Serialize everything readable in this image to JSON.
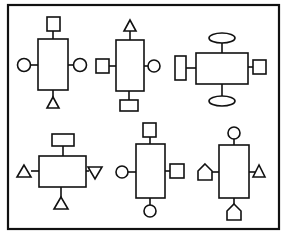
{
  "diagram": {
    "stroke_color": "#111111",
    "background": "#ffffff",
    "frame": {
      "x": 8,
      "y": 5,
      "width": 271,
      "height": 224
    },
    "nodes": [
      {
        "id": "node-1",
        "position": "top-left",
        "body": "tall-rectangle",
        "attachments": {
          "top": "square",
          "left": "circle",
          "right": "circle",
          "bottom": "triangle-up"
        }
      },
      {
        "id": "node-2",
        "position": "top-center",
        "body": "tall-rectangle",
        "attachments": {
          "top": "triangle-up",
          "left": "square",
          "right": "circle",
          "bottom": "wide-rectangle"
        }
      },
      {
        "id": "node-3",
        "position": "top-right",
        "body": "wide-rectangle",
        "attachments": {
          "top": "ellipse",
          "left": "tall-rectangle",
          "right": "square",
          "bottom": "ellipse"
        }
      },
      {
        "id": "node-4",
        "position": "bottom-left",
        "body": "wide-rectangle",
        "attachments": {
          "top": "wide-rectangle",
          "left": "triangle-up",
          "right": "triangle-down",
          "bottom": "triangle-up"
        }
      },
      {
        "id": "node-5",
        "position": "bottom-center",
        "body": "tall-rectangle",
        "attachments": {
          "top": "square",
          "left": "circle",
          "right": "square",
          "bottom": "circle"
        }
      },
      {
        "id": "node-6",
        "position": "bottom-right",
        "body": "tall-rectangle",
        "attachments": {
          "top": "circle",
          "left": "pentagon-house",
          "right": "triangle-up",
          "bottom": "pentagon-house"
        }
      }
    ]
  }
}
